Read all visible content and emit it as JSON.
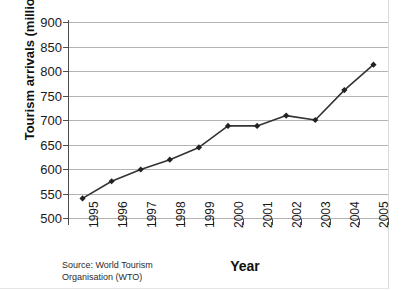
{
  "chart_data": {
    "type": "line",
    "title": "",
    "xlabel": "Year",
    "ylabel": "Tourism arrivals (millions)",
    "categories": [
      "1995",
      "1996",
      "1997",
      "1998",
      "1999",
      "2000",
      "2001",
      "2002",
      "2003",
      "2004",
      "2005"
    ],
    "values": [
      540,
      575,
      599,
      619,
      644,
      688,
      688,
      709,
      700,
      761,
      813
    ],
    "series": [
      {
        "name": "Tourism arrivals",
        "values": [
          540,
          575,
          599,
          619,
          644,
          688,
          688,
          709,
          700,
          761,
          813
        ]
      }
    ],
    "ylim": [
      500,
      900
    ],
    "y_ticks": [
      500,
      550,
      600,
      650,
      700,
      750,
      800,
      850,
      900
    ],
    "y_tick_labels": [
      "500",
      "550",
      "600",
      "650",
      "700",
      "750",
      "800",
      "850",
      "900"
    ],
    "grid": true,
    "legend": "none",
    "marker": "diamond",
    "line_color": "#333333",
    "marker_color": "#222222",
    "grid_color": "#b3b3b3",
    "axis_color": "#4d4d4d",
    "background_color": "#ffffff"
  },
  "source_note": {
    "line1": "Source: World Tourism",
    "line2": "Organisation (WTO)"
  }
}
